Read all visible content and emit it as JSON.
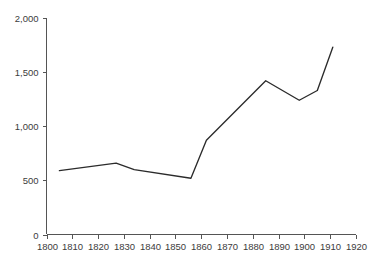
{
  "chart_data": {
    "type": "line",
    "title": "",
    "subtitle": "",
    "xlabel": "",
    "ylabel": "",
    "xlim": [
      1800,
      1920
    ],
    "ylim": [
      0,
      2000
    ],
    "grid": false,
    "legend": null,
    "line_color": "#2b2b2b",
    "axis_color": "#555555",
    "label_color": "#3c3c3c",
    "background": "#ffffff",
    "x_ticks": [
      1800,
      1810,
      1820,
      1830,
      1840,
      1850,
      1860,
      1870,
      1880,
      1890,
      1900,
      1910,
      1920
    ],
    "x_tick_labels": [
      "1800",
      "1810",
      "1820",
      "1830",
      "1840",
      "1850",
      "1860",
      "1870",
      "1880",
      "1890",
      "1900",
      "1910",
      "1920"
    ],
    "y_ticks": [
      0,
      500,
      1000,
      1500,
      2000
    ],
    "y_tick_labels": [
      "0",
      "500",
      "1,000",
      "1,500",
      "2,000"
    ],
    "series": [
      {
        "name": "series-1",
        "x": [
          1805,
          1827,
          1834,
          1856,
          1862,
          1885,
          1898,
          1905,
          1911
        ],
        "values": [
          590,
          660,
          600,
          520,
          870,
          1420,
          1240,
          1330,
          1730
        ]
      }
    ]
  }
}
